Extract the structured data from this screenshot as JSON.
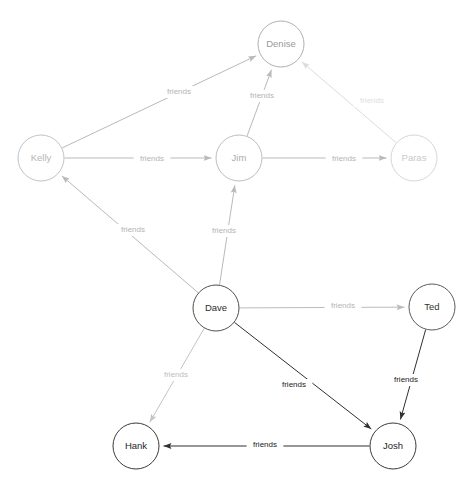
{
  "diagram": {
    "type": "directed-node-link-graph",
    "width": 474,
    "height": 489,
    "background": "#ffffff",
    "default_edge_label": "friends",
    "node_radius": 23,
    "colors": {
      "light_gray": "#b9b9b9",
      "very_light_gray": "#dcdcdc",
      "dark": "#4a4a4a",
      "near_black": "#1a1a1a",
      "node_fill": "#ffffff",
      "label_light": "#b9b9b9",
      "label_very_light": "#e0e0e0",
      "label_dark": "#222222"
    },
    "nodes": [
      {
        "id": "kelly",
        "label": "Kelly",
        "x": 41,
        "y": 158,
        "r": 23,
        "stroke": "#c2c2c2",
        "text_color": "#b5b5b5"
      },
      {
        "id": "denise",
        "label": "Denise",
        "x": 281,
        "y": 44,
        "r": 23,
        "stroke": "#b0b0b0",
        "text_color": "#9a9a9a"
      },
      {
        "id": "jim",
        "label": "Jim",
        "x": 239,
        "y": 158,
        "r": 23,
        "stroke": "#bdbdbd",
        "text_color": "#ababab"
      },
      {
        "id": "paras",
        "label": "Paras",
        "x": 414,
        "y": 158,
        "r": 23,
        "stroke": "#d6d6d6",
        "text_color": "#c9c9c9"
      },
      {
        "id": "dave",
        "label": "Dave",
        "x": 216,
        "y": 308,
        "r": 23,
        "stroke": "#4f4f4f",
        "text_color": "#2b2b2b"
      },
      {
        "id": "ted",
        "label": "Ted",
        "x": 432,
        "y": 307,
        "r": 23,
        "stroke": "#5a5a5a",
        "text_color": "#333333"
      },
      {
        "id": "hank",
        "label": "Hank",
        "x": 136,
        "y": 446,
        "r": 23,
        "stroke": "#3a3a3a",
        "text_color": "#1e1e1e"
      },
      {
        "id": "josh",
        "label": "Josh",
        "x": 393,
        "y": 446,
        "r": 23,
        "stroke": "#3a3a3a",
        "text_color": "#1e1e1e"
      }
    ],
    "edges": [
      {
        "id": "kelly-denise",
        "from": "kelly",
        "to": "denise",
        "label": "friends",
        "stroke": "#b9b9b9",
        "label_color": "#b4b4b4",
        "label_x": 179,
        "label_y": 92
      },
      {
        "id": "jim-denise",
        "from": "jim",
        "to": "denise",
        "label": "friends",
        "stroke": "#b9b9b9",
        "label_color": "#b4b4b4",
        "label_x": 262,
        "label_y": 96
      },
      {
        "id": "paras-denise",
        "from": "paras",
        "to": "denise",
        "label": "friends",
        "stroke": "#dcdcdc",
        "label_color": "#dedede",
        "label_x": 372,
        "label_y": 101
      },
      {
        "id": "kelly-jim",
        "from": "kelly",
        "to": "jim",
        "label": "friends",
        "stroke": "#b9b9b9",
        "label_color": "#b4b4b4",
        "label_x": 152,
        "label_y": 159
      },
      {
        "id": "jim-paras",
        "from": "jim",
        "to": "paras",
        "label": "friends",
        "stroke": "#b9b9b9",
        "label_color": "#b4b4b4",
        "label_x": 344,
        "label_y": 159
      },
      {
        "id": "dave-kelly",
        "from": "dave",
        "to": "kelly",
        "label": "friends",
        "stroke": "#b9b9b9",
        "label_color": "#b4b4b4",
        "label_x": 133,
        "label_y": 230
      },
      {
        "id": "dave-jim",
        "from": "dave",
        "to": "jim",
        "label": "friends",
        "stroke": "#b9b9b9",
        "label_color": "#b4b4b4",
        "label_x": 224,
        "label_y": 231
      },
      {
        "id": "dave-ted",
        "from": "dave",
        "to": "ted",
        "label": "friends",
        "stroke": "#bcbcbc",
        "label_color": "#b4b4b4",
        "label_x": 343,
        "label_y": 306
      },
      {
        "id": "dave-hank",
        "from": "dave",
        "to": "hank",
        "label": "friends",
        "stroke": "#c4c4c4",
        "label_color": "#bdbdbd",
        "label_x": 176,
        "label_y": 375
      },
      {
        "id": "dave-josh",
        "from": "dave",
        "to": "josh",
        "label": "friends",
        "stroke": "#2f2f2f",
        "label_color": "#1c1c1c",
        "label_x": 294,
        "label_y": 385
      },
      {
        "id": "ted-josh",
        "from": "ted",
        "to": "josh",
        "label": "friends",
        "stroke": "#2f2f2f",
        "label_color": "#1c1c1c",
        "label_x": 406,
        "label_y": 380
      },
      {
        "id": "josh-hank",
        "from": "josh",
        "to": "hank",
        "label": "friends",
        "stroke": "#2f2f2f",
        "label_color": "#1c1c1c",
        "label_x": 265,
        "label_y": 445
      }
    ],
    "footer_text": ""
  }
}
